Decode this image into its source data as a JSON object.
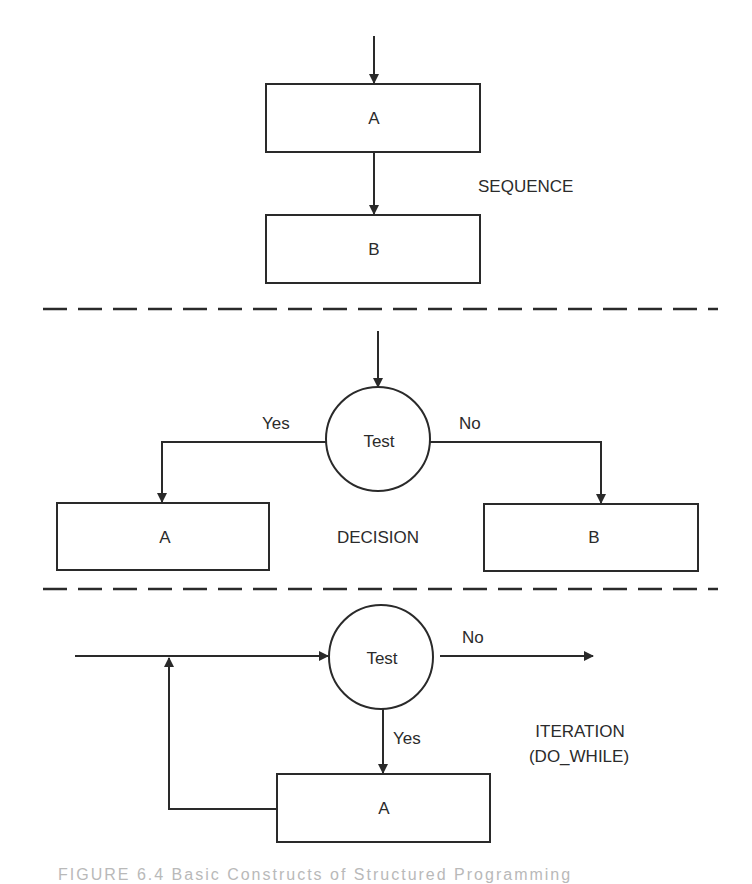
{
  "colors": {
    "line": "#2a2a2a",
    "text": "#2b2b2b",
    "background": "#ffffff"
  },
  "sequence": {
    "title": "SEQUENCE",
    "box_a": "A",
    "box_b": "B"
  },
  "decision": {
    "title": "DECISION",
    "test": "Test",
    "yes": "Yes",
    "no": "No",
    "box_a": "A",
    "box_b": "B"
  },
  "iteration": {
    "title_line1": "ITERATION",
    "title_line2": "(DO_WHILE)",
    "test": "Test",
    "yes": "Yes",
    "no": "No",
    "box_a": "A"
  },
  "caption": "FIGURE 6.4   Basic Constructs of Structured Programming"
}
